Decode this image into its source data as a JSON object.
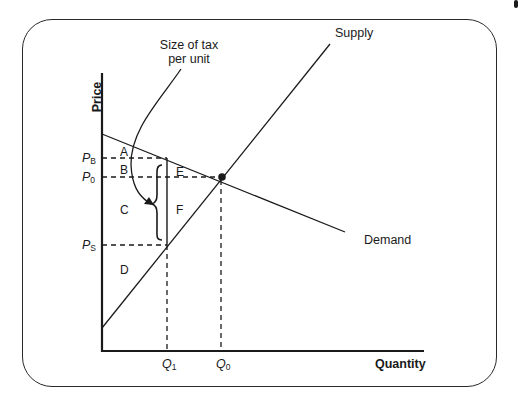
{
  "diagram": {
    "axes": {
      "y_label": "Price",
      "x_label": "Quantity"
    },
    "curves": {
      "supply_label": "Supply",
      "demand_label": "Demand"
    },
    "annotation": {
      "line1": "Size of tax",
      "line2": "per unit"
    },
    "price_ticks": [
      {
        "base": "P",
        "sub": "B"
      },
      {
        "base": "P",
        "sub": "0"
      },
      {
        "base": "P",
        "sub": "S"
      }
    ],
    "quantity_ticks": [
      {
        "base": "Q",
        "sub": "1"
      },
      {
        "base": "Q",
        "sub": "0"
      }
    ],
    "regions": [
      "A",
      "B",
      "C",
      "D",
      "E",
      "F"
    ],
    "colors": {
      "line": "#1a1a1a",
      "background": "#ffffff"
    }
  }
}
